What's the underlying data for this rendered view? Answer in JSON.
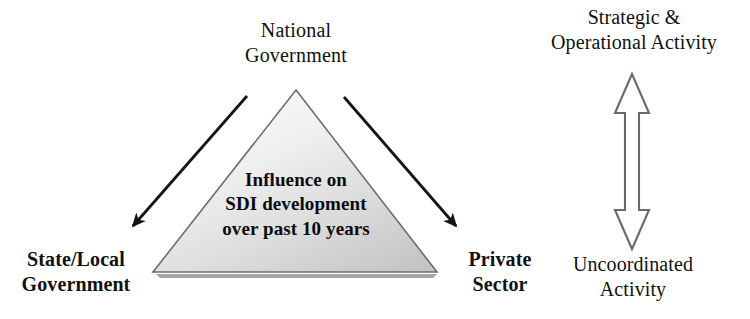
{
  "figure": {
    "background_color": "#ffffff",
    "text_color": "#111111"
  },
  "triangle": {
    "name": "influence-triangle",
    "caption_lines": [
      "Influence on",
      "SDI development",
      "over past 10 years"
    ],
    "caption_text": "Influence on SDI development over past 10 years",
    "fill_light": "#fbfbfb",
    "fill_dark": "#c6c6c6",
    "outline_color": "#6e6e6e",
    "base_shadow_color": "#9a9a9a"
  },
  "nodes": {
    "apex": {
      "name": "national-government",
      "lines": [
        "National",
        "Government"
      ],
      "text": "National Government"
    },
    "bottom_left": {
      "name": "state-local-government",
      "lines": [
        "State/Local",
        "Government"
      ],
      "text": "State/Local Government"
    },
    "bottom_right": {
      "name": "private-sector",
      "lines": [
        "Private",
        "Sector"
      ],
      "text": "Private Sector"
    }
  },
  "arrows": {
    "left": {
      "name": "arrow-national-to-state-local",
      "style": "solid-filled-head",
      "color": "#151515",
      "direction": "down-left"
    },
    "right": {
      "name": "arrow-national-to-private-sector",
      "style": "solid-filled-head",
      "color": "#151515",
      "direction": "down-right"
    }
  },
  "spectrum": {
    "name": "activity-spectrum",
    "arrow": {
      "name": "double-headed-vertical-arrow",
      "style": "hollow-outline",
      "fill": "#ffffff",
      "outline_color": "#6a6a6a",
      "direction": "bidirectional-vertical"
    },
    "top_label": {
      "name": "strategic-operational-activity",
      "lines": [
        "Strategic &",
        "Operational Activity"
      ],
      "text": "Strategic & Operational Activity"
    },
    "bottom_label": {
      "name": "uncoordinated-activity",
      "lines": [
        "Uncoordinated",
        "Activity"
      ],
      "text": "Uncoordinated Activity"
    }
  }
}
